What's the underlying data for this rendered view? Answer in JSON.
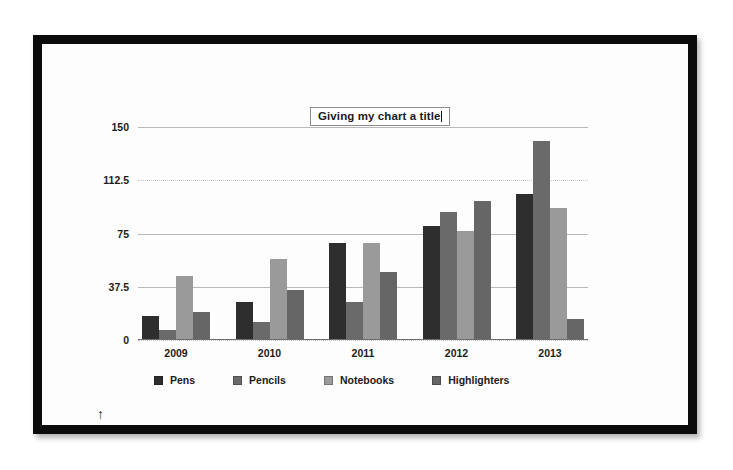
{
  "window": {
    "background_color": "#ffffff",
    "frame_color": "#0b0b0b"
  },
  "title": {
    "text": "Giving my chart a title",
    "editing": true,
    "box_border_color": "#8d8d8d"
  },
  "stray_marker": {
    "glyph": "↑"
  },
  "legend": {
    "position": "bottom",
    "items": [
      {
        "label": "Pens",
        "color": "#2e2e2e"
      },
      {
        "label": "Pencils",
        "color": "#6a6a6a"
      },
      {
        "label": "Notebooks",
        "color": "#9a9a9a"
      },
      {
        "label": "Highlighters",
        "color": "#666666"
      }
    ]
  },
  "axis": {
    "y_ticks": [
      "150",
      "112.5",
      "75",
      "37.5",
      "0"
    ],
    "x_ticks": [
      "2009",
      "2010",
      "2011",
      "2012",
      "2013"
    ]
  },
  "chart_data": {
    "type": "bar",
    "title": "Giving my chart a title",
    "xlabel": "",
    "ylabel": "",
    "ylim": [
      0,
      150
    ],
    "yticks": [
      0,
      37.5,
      75,
      112.5,
      150
    ],
    "grid": true,
    "legend_position": "bottom",
    "categories": [
      "2009",
      "2010",
      "2011",
      "2012",
      "2013"
    ],
    "series": [
      {
        "name": "Pens",
        "color": "#2e2e2e",
        "values": [
          17,
          27,
          68,
          80,
          103
        ]
      },
      {
        "name": "Pencils",
        "color": "#6a6a6a",
        "values": [
          7,
          13,
          27,
          90,
          140
        ]
      },
      {
        "name": "Notebooks",
        "color": "#9a9a9a",
        "values": [
          45,
          57,
          68,
          77,
          93
        ]
      },
      {
        "name": "Highlighters",
        "color": "#666666",
        "values": [
          20,
          35,
          48,
          98,
          15
        ]
      }
    ]
  }
}
